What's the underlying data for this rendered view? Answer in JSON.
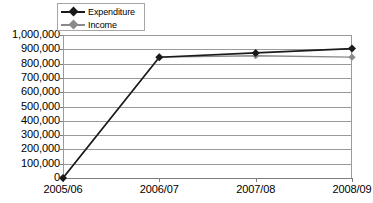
{
  "chart_data": {
    "type": "line",
    "title": "",
    "xlabel": "",
    "ylabel": "",
    "categories": [
      "2005/06",
      "2006/07",
      "2007/08",
      "2008/09"
    ],
    "series": [
      {
        "name": "Expenditure",
        "color": "#1a1a1a",
        "values": [
          0,
          845000,
          875000,
          905000
        ]
      },
      {
        "name": "Income",
        "color": "#8a8a8a",
        "values": [
          0,
          845000,
          855000,
          845000
        ]
      }
    ],
    "ylim": [
      0,
      1000000
    ],
    "ytick_step": 100000,
    "ytick_labels": [
      "1,000,000",
      "900,000",
      "800,000",
      "700,000",
      "600,000",
      "500,000",
      "400,000",
      "300,000",
      "200,000",
      "100,000",
      "0"
    ],
    "grid": true,
    "legend_position": "top-left",
    "marker": "diamond"
  },
  "legend": {
    "entries": [
      {
        "label": "Expenditure",
        "color": "#1a1a1a",
        "marker": "diamond-marker"
      },
      {
        "label": "Income",
        "color": "#8a8a8a",
        "marker": "diamond-marker"
      }
    ]
  },
  "colors": {
    "expenditure": "#1a1a1a",
    "income": "#8a8a8a",
    "gridline": "#9a9a9a",
    "axis": "#7d7d7d",
    "background": "#ffffff",
    "legend_border": "#a6a6a6"
  }
}
